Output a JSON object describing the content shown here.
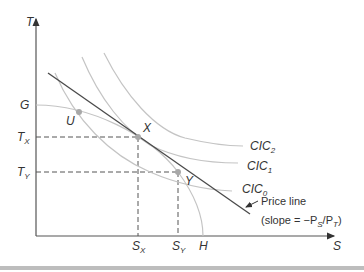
{
  "diagram": {
    "axes": {
      "y_label": "T",
      "x_label": "S"
    },
    "frontier_labels": {
      "g": "G",
      "h": "H"
    },
    "points": {
      "u": "U",
      "x": "X",
      "y": "Y"
    },
    "t_labels": {
      "tx_main": "T",
      "tx_sub": "X",
      "ty_main": "T",
      "ty_sub": "Y"
    },
    "s_labels": {
      "sx_main": "S",
      "sx_sub": "X",
      "sy_main": "S",
      "sy_sub": "Y"
    },
    "curves": [
      {
        "main": "CIC",
        "sub": "2"
      },
      {
        "main": "CIC",
        "sub": "1"
      },
      {
        "main": "CIC",
        "sub": "0"
      }
    ],
    "price_line": {
      "label": "Price line",
      "slope_prefix": "(slope = −P",
      "slope_sub1": "S",
      "slope_mid": "/P",
      "slope_sub2": "T",
      "slope_suffix": ")"
    },
    "colors": {
      "axis": "#555555",
      "curve": "#bdbdbd",
      "price_line": "#4a4a4a",
      "point": "#a8a8a8",
      "dash": "#555555"
    }
  }
}
